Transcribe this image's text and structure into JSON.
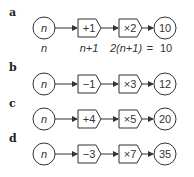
{
  "rows": [
    {
      "label": "a",
      "input": "n",
      "op1": "+1",
      "op2": "×2",
      "output": "10",
      "sub": {
        "input": "n",
        "step1": "n+1",
        "step2": "2(n+1)",
        "eq": "=",
        "result": "10"
      }
    },
    {
      "label": "b",
      "input": "n",
      "op1": "−1",
      "op2": "×3",
      "output": "12"
    },
    {
      "label": "c",
      "input": "n",
      "op1": "+4",
      "op2": "×5",
      "output": "20"
    },
    {
      "label": "d",
      "input": "n",
      "op1": "−3",
      "op2": "×7",
      "output": "35"
    }
  ]
}
